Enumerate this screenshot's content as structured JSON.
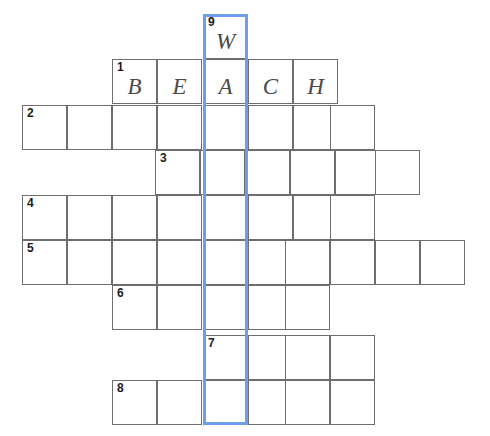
{
  "puzzle": {
    "title": "Crossword Puzzle Grid",
    "grid": {
      "cell_size": 45,
      "columns_x": [
        22,
        67,
        112,
        157,
        203,
        248,
        293,
        338,
        375,
        420
      ],
      "rows_y": [
        14,
        59,
        105,
        150,
        195,
        240,
        285,
        335,
        380
      ]
    },
    "highlight": {
      "color": "#6d9eeb",
      "x": 203,
      "y": 14,
      "width": 45,
      "height": 411,
      "label": "vertical-word-9-down"
    },
    "entries": [
      {
        "number": "9",
        "direction": "down",
        "start_row": 0,
        "start_col": 4,
        "length": 9,
        "cells": [
          {
            "row": 0,
            "col": 4,
            "letter": "W",
            "number": "9"
          },
          {
            "row": 1,
            "col": 4,
            "letter": "A",
            "number": ""
          },
          {
            "row": 2,
            "col": 4,
            "letter": "",
            "number": ""
          },
          {
            "row": 3,
            "col": 4,
            "letter": "",
            "number": ""
          },
          {
            "row": 4,
            "col": 4,
            "letter": "",
            "number": ""
          },
          {
            "row": 5,
            "col": 4,
            "letter": "",
            "number": ""
          },
          {
            "row": 6,
            "col": 4,
            "letter": "",
            "number": ""
          },
          {
            "row": 7,
            "col": 4,
            "letter": "",
            "number": "7"
          },
          {
            "row": 8,
            "col": 4,
            "letter": "",
            "number": ""
          }
        ]
      }
    ],
    "rows": [
      {
        "row_index": 0,
        "y": 14,
        "start_col": 4,
        "cells": [
          {
            "x": 203,
            "letter": "W",
            "number": "9"
          }
        ]
      },
      {
        "row_index": 1,
        "y": 59,
        "start_col": 2,
        "word": "BEACH",
        "cells": [
          {
            "x": 112,
            "letter": "B",
            "number": "1"
          },
          {
            "x": 157,
            "letter": "E",
            "number": ""
          },
          {
            "x": 203,
            "letter": "A",
            "number": ""
          },
          {
            "x": 248,
            "letter": "C",
            "number": ""
          },
          {
            "x": 293,
            "letter": "H",
            "number": ""
          }
        ]
      },
      {
        "row_index": 2,
        "y": 105,
        "start_col": 0,
        "cells": [
          {
            "x": 22,
            "letter": "",
            "number": "2"
          },
          {
            "x": 67,
            "letter": "",
            "number": ""
          },
          {
            "x": 112,
            "letter": "",
            "number": ""
          },
          {
            "x": 157,
            "letter": "",
            "number": ""
          },
          {
            "x": 203,
            "letter": "",
            "number": ""
          },
          {
            "x": 248,
            "letter": "",
            "number": ""
          },
          {
            "x": 293,
            "letter": "",
            "number": ""
          },
          {
            "x": 330,
            "letter": "",
            "number": ""
          }
        ]
      },
      {
        "row_index": 3,
        "y": 150,
        "start_col": 3,
        "cells": [
          {
            "x": 155,
            "letter": "",
            "number": "3"
          },
          {
            "x": 200,
            "letter": "",
            "number": ""
          },
          {
            "x": 245,
            "letter": "",
            "number": ""
          },
          {
            "x": 290,
            "letter": "",
            "number": ""
          },
          {
            "x": 335,
            "letter": "",
            "number": ""
          },
          {
            "x": 375,
            "letter": "",
            "number": ""
          }
        ]
      },
      {
        "row_index": 4,
        "y": 195,
        "start_col": 0,
        "cells": [
          {
            "x": 22,
            "letter": "",
            "number": "4"
          },
          {
            "x": 67,
            "letter": "",
            "number": ""
          },
          {
            "x": 112,
            "letter": "",
            "number": ""
          },
          {
            "x": 157,
            "letter": "",
            "number": ""
          },
          {
            "x": 203,
            "letter": "",
            "number": ""
          },
          {
            "x": 248,
            "letter": "",
            "number": ""
          },
          {
            "x": 293,
            "letter": "",
            "number": ""
          },
          {
            "x": 330,
            "letter": "",
            "number": ""
          }
        ]
      },
      {
        "row_index": 5,
        "y": 240,
        "start_col": 0,
        "cells": [
          {
            "x": 22,
            "letter": "",
            "number": "5"
          },
          {
            "x": 67,
            "letter": "",
            "number": ""
          },
          {
            "x": 112,
            "letter": "",
            "number": ""
          },
          {
            "x": 157,
            "letter": "",
            "number": ""
          },
          {
            "x": 203,
            "letter": "",
            "number": ""
          },
          {
            "x": 248,
            "letter": "",
            "number": ""
          },
          {
            "x": 285,
            "letter": "",
            "number": ""
          },
          {
            "x": 330,
            "letter": "",
            "number": ""
          },
          {
            "x": 375,
            "letter": "",
            "number": ""
          },
          {
            "x": 420,
            "letter": "",
            "number": ""
          }
        ]
      },
      {
        "row_index": 6,
        "y": 285,
        "start_col": 2,
        "cells": [
          {
            "x": 112,
            "letter": "",
            "number": "6"
          },
          {
            "x": 157,
            "letter": "",
            "number": ""
          },
          {
            "x": 203,
            "letter": "",
            "number": ""
          },
          {
            "x": 248,
            "letter": "",
            "number": ""
          },
          {
            "x": 285,
            "letter": "",
            "number": ""
          }
        ]
      },
      {
        "row_index": 7,
        "y": 335,
        "start_col": 4,
        "cells": [
          {
            "x": 203,
            "letter": "",
            "number": "7"
          },
          {
            "x": 248,
            "letter": "",
            "number": ""
          },
          {
            "x": 285,
            "letter": "",
            "number": ""
          },
          {
            "x": 330,
            "letter": "",
            "number": ""
          }
        ]
      },
      {
        "row_index": 8,
        "y": 380,
        "start_col": 2,
        "cells": [
          {
            "x": 112,
            "letter": "",
            "number": "8"
          },
          {
            "x": 157,
            "letter": "",
            "number": ""
          },
          {
            "x": 203,
            "letter": "",
            "number": ""
          },
          {
            "x": 248,
            "letter": "",
            "number": ""
          },
          {
            "x": 285,
            "letter": "",
            "number": ""
          },
          {
            "x": 330,
            "letter": "",
            "number": ""
          }
        ]
      }
    ]
  }
}
